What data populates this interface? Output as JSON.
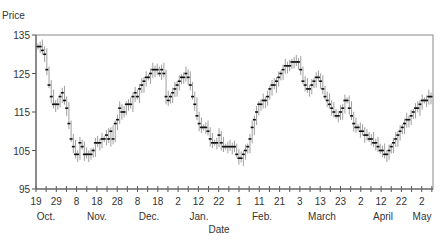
{
  "chart_data": {
    "type": "line",
    "style": "high-low-close bars",
    "title": "",
    "ylabel": "Price",
    "xlabel": "Date",
    "ylim": [
      95,
      135
    ],
    "yticks": [
      95,
      105,
      115,
      125,
      135
    ],
    "grid": false,
    "legend": null,
    "xtick_labels": [
      "19",
      "29",
      "8",
      "18",
      "28",
      "8",
      "18",
      "2",
      "12",
      "22",
      "1",
      "11",
      "21",
      "3",
      "13",
      "23",
      "2",
      "12",
      "22",
      "2"
    ],
    "month_labels": [
      {
        "label": "Oct.",
        "x": 46
      },
      {
        "label": "Nov.",
        "x": 97
      },
      {
        "label": "Dec.",
        "x": 149
      },
      {
        "label": "Jan.",
        "x": 199
      },
      {
        "label": "Feb.",
        "x": 262
      },
      {
        "label": "March",
        "x": 322
      },
      {
        "label": "April",
        "x": 383
      },
      {
        "label": "May",
        "x": 422
      }
    ],
    "x_start_date": "Oct 19",
    "x_end_date": "May 2",
    "series": [
      {
        "name": "Price",
        "values": [
          132,
          132,
          131,
          130,
          126,
          122,
          119,
          117,
          117,
          117,
          119,
          120,
          118,
          116,
          112,
          108,
          106,
          104,
          104,
          107,
          106,
          104,
          104,
          104,
          104,
          105,
          107,
          107,
          107,
          108,
          108,
          109,
          108,
          110,
          108,
          112,
          113,
          116,
          115,
          115,
          117,
          117,
          117,
          119,
          120,
          119,
          121,
          122,
          123,
          124,
          124,
          125,
          126,
          126,
          126,
          125,
          126,
          125,
          119,
          118,
          119,
          120,
          121,
          122,
          123,
          124,
          124,
          125,
          124,
          122,
          119,
          117,
          114,
          112,
          111,
          111,
          111,
          110,
          108,
          107,
          107,
          107,
          109,
          107,
          106,
          106,
          106,
          106,
          106,
          106,
          104,
          103,
          103,
          104,
          105,
          106,
          108,
          111,
          113,
          115,
          117,
          117,
          118,
          118,
          119,
          121,
          122,
          122,
          123,
          124,
          125,
          126,
          127,
          127,
          127,
          128,
          128,
          128,
          128,
          126,
          123,
          122,
          121,
          121,
          122,
          123,
          124,
          124,
          123,
          121,
          119,
          118,
          117,
          116,
          115,
          114,
          114,
          115,
          116,
          118,
          118,
          116,
          114,
          112,
          111,
          111,
          110,
          110,
          109,
          109,
          108,
          108,
          107,
          107,
          106,
          105,
          105,
          104,
          104,
          105,
          106,
          107,
          108,
          109,
          110,
          111,
          112,
          113,
          113,
          114,
          115,
          116,
          116,
          117,
          118,
          118,
          118,
          119,
          119
        ]
      }
    ]
  }
}
